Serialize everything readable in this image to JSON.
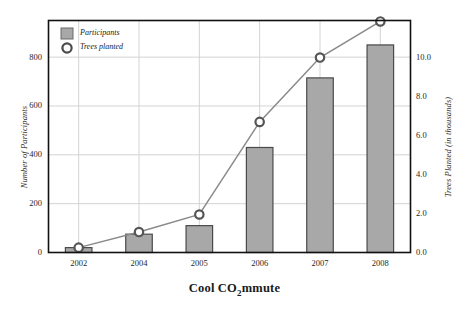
{
  "chart_data": {
    "type": "bar",
    "title": "Cool CO2mmute",
    "title_prefix": "Cool CO",
    "title_sub": "2",
    "title_suffix": "mmute",
    "xlabel": "",
    "categories": [
      "2002",
      "2004",
      "2005",
      "2006",
      "2007",
      "2008"
    ],
    "grid": true,
    "legend_position": "top-left",
    "series": [
      {
        "name": "Participants",
        "type": "bar",
        "axis": "left",
        "ylabel": "Number of Participants",
        "ylim": [
          0,
          950
        ],
        "yticks": [
          0,
          200,
          400,
          600,
          800
        ],
        "ytick_labels": [
          "0",
          "200",
          "400",
          "600",
          "800"
        ],
        "values": [
          20,
          75,
          110,
          430,
          715,
          850
        ],
        "color": "#a8a8a8",
        "edge_color": "#4a4a4a"
      },
      {
        "name": "Trees planted",
        "type": "line",
        "axis": "right",
        "ylabel": "Trees Planted (in thousands)",
        "ylim": [
          0,
          11.9
        ],
        "yticks": [
          0.0,
          2.0,
          4.0,
          6.0,
          8.0,
          10.0
        ],
        "ytick_labels": [
          "0.0",
          "2.0",
          "4.0",
          "6.0",
          "8.0",
          "10.0"
        ],
        "values": [
          0.25,
          1.05,
          1.95,
          6.7,
          10.0,
          11.85
        ],
        "color": "#8a8a8a",
        "marker": "circle-open"
      }
    ],
    "colors": {
      "bar_fill": "#a8a8a8",
      "bar_edge": "#4a4a4a",
      "line": "#8a8a8a",
      "frame": "#111111",
      "grid": "#cfcfcf",
      "background": "#ffffff",
      "text": "#1a1a1a"
    }
  },
  "legend": {
    "items": [
      {
        "label": "Participants",
        "icon": "square-swatch-icon"
      },
      {
        "label": "Trees planted",
        "icon": "circle-marker-icon"
      }
    ]
  }
}
